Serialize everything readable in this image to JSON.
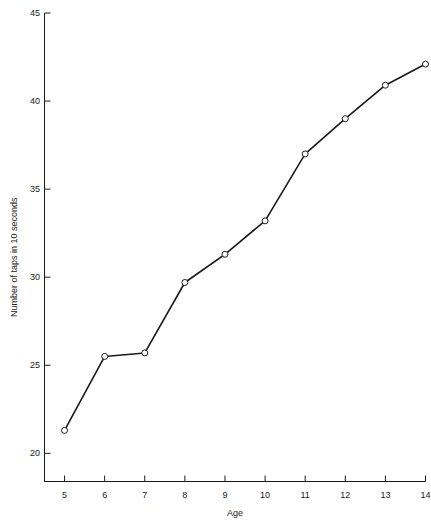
{
  "chart_data": {
    "type": "line",
    "title": "",
    "xlabel": "Age",
    "ylabel": "Number of taps in 10 seconds",
    "x": [
      5,
      6,
      7,
      8,
      9,
      10,
      11,
      12,
      13,
      14
    ],
    "values": [
      21.3,
      25.5,
      25.7,
      29.7,
      31.3,
      33.2,
      37.0,
      39.0,
      40.9,
      42.1
    ],
    "categories": [
      "5",
      "6",
      "7",
      "8",
      "9",
      "10",
      "11",
      "12",
      "13",
      "14"
    ],
    "xlim": [
      4.5,
      14
    ],
    "ylim": [
      18.4,
      45
    ],
    "xticks": [
      5,
      6,
      7,
      8,
      9,
      10,
      11,
      12,
      13,
      14
    ],
    "xtick_labels": [
      "5",
      "6",
      "7",
      "8",
      "9",
      "10",
      "11",
      "12",
      "13",
      "14"
    ],
    "yticks": [
      20,
      25,
      30,
      35,
      40,
      45
    ],
    "ytick_labels": [
      "20",
      "25",
      "30",
      "35",
      "40",
      "45"
    ],
    "grid": false,
    "legend": false,
    "marker": "open-circle",
    "line_color": "#1a1a1a",
    "marker_fill": "#ffffff",
    "marker_edge": "#1a1a1a",
    "background": "#ffffff"
  },
  "axes": {
    "x_title": "Age",
    "y_title": "Number of taps in 10 seconds"
  }
}
